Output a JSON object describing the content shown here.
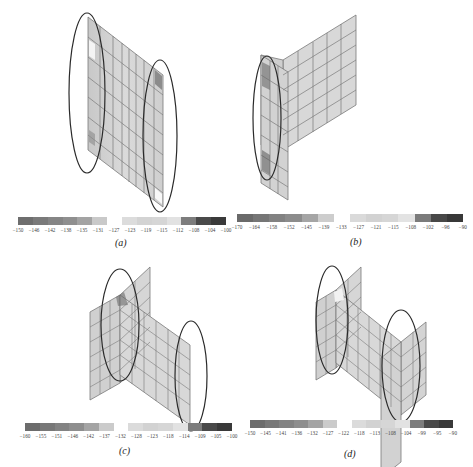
{
  "figure": {
    "panels": [
      {
        "id": "a",
        "caption": "(a)",
        "colorbar": {
          "ticks": [
            "−150",
            "−146",
            "−142",
            "−138",
            "−135",
            "−131",
            "−127",
            "−123",
            "−119",
            "−115",
            "−112",
            "−108",
            "−104",
            "−100"
          ],
          "colors": [
            "#6e6e6e",
            "#7a7a7a",
            "#858585",
            "#8f8f8f",
            "#a3a3a3",
            "#c9c9c9",
            "#ffffff",
            "#dcdcdc",
            "#d3d3d3",
            "#d6d6d6",
            "#e2e2e2",
            "#7d7d7d",
            "#4a4a4a",
            "#3a3a3a"
          ]
        }
      },
      {
        "id": "b",
        "caption": "(b)",
        "colorbar": {
          "ticks": [
            "−170",
            "−164",
            "−158",
            "−152",
            "−145",
            "−139",
            "−133",
            "−127",
            "−121",
            "−115",
            "−108",
            "−102",
            "−96",
            "−90"
          ],
          "colors": [
            "#6a6a6a",
            "#767676",
            "#828282",
            "#8c8c8c",
            "#a5a5a5",
            "#cdcdcd",
            "#ffffff",
            "#dadada",
            "#d2d2d2",
            "#d6d6d6",
            "#e3e3e3",
            "#7b7b7b",
            "#484848",
            "#383838"
          ]
        }
      },
      {
        "id": "c",
        "caption": "(c)",
        "colorbar": {
          "ticks": [
            "−160",
            "−155",
            "−151",
            "−146",
            "−142",
            "−137",
            "−132",
            "−128",
            "−123",
            "−118",
            "−114",
            "−109",
            "−105",
            "−100"
          ],
          "colors": [
            "#6c6c6c",
            "#787878",
            "#838383",
            "#8e8e8e",
            "#a4a4a4",
            "#cbcbcb",
            "#ffffff",
            "#dbdbdb",
            "#d2d2d2",
            "#d6d6d6",
            "#e2e2e2",
            "#7c7c7c",
            "#494949",
            "#393939"
          ]
        }
      },
      {
        "id": "d",
        "caption": "(d)",
        "colorbar": {
          "ticks": [
            "−150",
            "−145",
            "−141",
            "−136",
            "−132",
            "−127",
            "−122",
            "−118",
            "−113",
            "−108",
            "−104",
            "−99",
            "−95",
            "−90"
          ],
          "colors": [
            "#6c6c6c",
            "#787878",
            "#838383",
            "#8e8e8e",
            "#a4a4a4",
            "#cbcbcb",
            "#ffffff",
            "#dbdbdb",
            "#d2d2d2",
            "#d6d6d6",
            "#e2e2e2",
            "#7c7c7c",
            "#494949",
            "#393939"
          ]
        }
      }
    ],
    "colors": {
      "mesh_fill": "#d4d4d4",
      "mesh_line": "#7a7a7a",
      "ellipse": "#2a2a2a"
    }
  }
}
